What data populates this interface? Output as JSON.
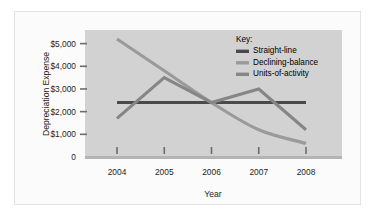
{
  "figure": {
    "background_color": "#fbfbfb",
    "plot_background_color": "#d2d2d2",
    "frame_border_color": "#e3e3e3"
  },
  "chart_data": {
    "type": "line",
    "title": "",
    "xlabel": "Year",
    "ylabel": "Depreciation Expense",
    "categories": [
      "2004",
      "2005",
      "2006",
      "2007",
      "2008"
    ],
    "x_tick_labels": [
      "2004",
      "2005",
      "2006",
      "2007",
      "2008"
    ],
    "y_tick_labels": [
      "0",
      "$1,000",
      "$2,000",
      "$3,000",
      "$4,000",
      "$5,000"
    ],
    "y_tick_values": [
      0,
      1000,
      2000,
      3000,
      4000,
      5000
    ],
    "ylim": [
      0,
      5600
    ],
    "grid": false,
    "legend_position": "inside-top-right",
    "legend_title": "Key:",
    "series": [
      {
        "name": "Straight-line",
        "color": "#4a4a4a",
        "values": [
          2400,
          2400,
          2400,
          2400,
          2400
        ]
      },
      {
        "name": "Declining-balance",
        "color": "#9a9a9a",
        "values": [
          5200,
          3800,
          2400,
          1200,
          600
        ]
      },
      {
        "name": "Units-of-activity",
        "color": "#868686",
        "values": [
          1700,
          3500,
          2400,
          3000,
          1200
        ]
      }
    ]
  },
  "axes": {
    "y_axis_title": "Depreciation Expense",
    "x_axis_title": "Year"
  },
  "legend": {
    "title": "Key:",
    "items": [
      {
        "label": "Straight-line",
        "color": "#4a4a4a"
      },
      {
        "label": "Declining-balance",
        "color": "#9a9a9a"
      },
      {
        "label": "Units-of-activity",
        "color": "#868686"
      }
    ]
  }
}
